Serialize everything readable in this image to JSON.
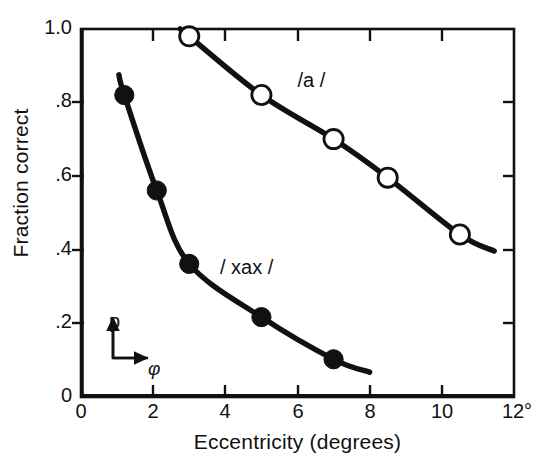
{
  "chart_data": {
    "type": "line",
    "title": "",
    "xlabel": "Eccentricity (degrees)",
    "ylabel": "Fraction correct",
    "xlim": [
      0,
      12
    ],
    "ylim": [
      0,
      1.0
    ],
    "grid": false,
    "legend_position": "inline-annotations",
    "x_tick_labels": [
      "0",
      "2",
      "4",
      "6",
      "8",
      "10",
      "12°"
    ],
    "x_tick_values": [
      0,
      2,
      4,
      6,
      8,
      10,
      12
    ],
    "y_tick_labels": [
      "0",
      ".2",
      ".4",
      ".6",
      ".8",
      "1.0"
    ],
    "y_tick_values": [
      0,
      0.2,
      0.4,
      0.6,
      0.8,
      1.0
    ],
    "series": [
      {
        "name": "/a /",
        "marker": "open-circle",
        "label_x": 6.0,
        "label_y": 0.855,
        "x": [
          3.0,
          5.0,
          7.0,
          8.5,
          10.5
        ],
        "y": [
          0.98,
          0.82,
          0.7,
          0.595,
          0.44
        ],
        "line_extent_x": [
          2.75,
          11.45
        ],
        "line_extent_y": [
          1.0,
          0.395
        ]
      },
      {
        "name": "/ xax /",
        "marker": "filled-circle",
        "label_x": 3.85,
        "label_y": 0.345,
        "x": [
          1.2,
          2.1,
          3.0,
          5.0,
          7.0
        ],
        "y": [
          0.82,
          0.56,
          0.36,
          0.215,
          0.1
        ],
        "line_extent_x": [
          1.05,
          8.0
        ],
        "line_extent_y": [
          0.875,
          0.065
        ]
      }
    ],
    "annotations": [
      {
        "name": "inset-axis-vertical-label",
        "text": "p"
      },
      {
        "name": "inset-axis-horizontal-label",
        "text": "φ"
      }
    ],
    "colors": {
      "ink": "#111111",
      "background": "#ffffff"
    }
  },
  "axes": {
    "x_title": "Eccentricity (degrees)",
    "y_title": "Fraction correct"
  }
}
